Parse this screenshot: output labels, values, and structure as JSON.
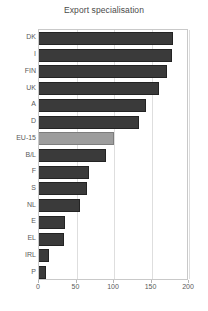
{
  "chart_data": {
    "type": "bar",
    "orientation": "horizontal",
    "title": "Export specialisation",
    "xlabel": "",
    "ylabel": "",
    "categories": [
      "DK",
      "I",
      "FIN",
      "UK",
      "A",
      "D",
      "EU-15",
      "B/L",
      "F",
      "S",
      "NL",
      "E",
      "EL",
      "IRL",
      "P"
    ],
    "values": [
      179,
      177,
      171,
      160,
      143,
      133,
      100,
      89,
      67,
      64,
      55,
      35,
      33,
      13,
      9
    ],
    "highlight_category": "EU-15",
    "xlim": [
      0,
      200
    ],
    "xticks": [
      0,
      50,
      100,
      150,
      200
    ],
    "xtick_labels": [
      "0",
      "50",
      "100",
      "150",
      "200"
    ],
    "grid": true,
    "legend": false,
    "bar_color": "#3a3a3a",
    "highlight_color": "#9d9d9d"
  }
}
